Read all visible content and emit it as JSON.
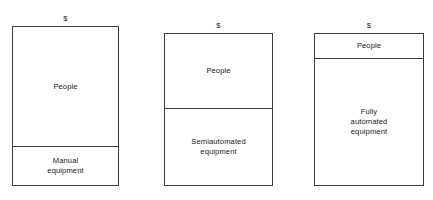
{
  "chart_data": {
    "type": "bar",
    "title": "",
    "subtitle": "",
    "xlabel": "",
    "ylabel": "$",
    "orientation": "vertical",
    "stacked": true,
    "grid": false,
    "legend": "none",
    "axis_tick_labels": [],
    "categories": [
      "Manual equipment",
      "Semiautomated equipment",
      "Fully automated equipment"
    ],
    "series": [
      {
        "name": "People",
        "values": [
          76,
          49,
          16
        ]
      },
      {
        "name": "Equipment",
        "values": [
          24,
          51,
          84
        ]
      }
    ],
    "ylim": [
      0,
      100
    ],
    "annotations": [
      "$",
      "$",
      "$"
    ]
  },
  "panels": [
    {
      "axis_label": "$",
      "segments": [
        {
          "label": "People",
          "share": 76
        },
        {
          "label": "Manual\nequipment",
          "share": 24
        }
      ]
    },
    {
      "axis_label": "$",
      "segments": [
        {
          "label": "People",
          "share": 49
        },
        {
          "label": "Semiautomated\nequipment",
          "share": 51
        }
      ]
    },
    {
      "axis_label": "$",
      "segments": [
        {
          "label": "People",
          "share": 16
        },
        {
          "label": "Fully\nautomated\nequipment",
          "share": 84
        }
      ]
    }
  ],
  "colors": {
    "stroke": "#3c3c3c",
    "fill": "#ffffff",
    "text": "#1a1a1a",
    "background": "#ffffff"
  }
}
